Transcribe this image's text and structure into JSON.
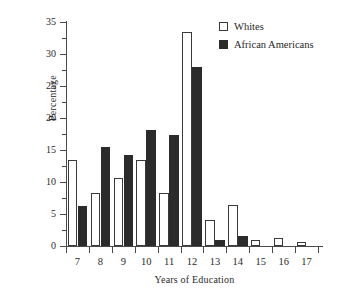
{
  "chart_data": {
    "type": "bar",
    "title": "",
    "subtitle": "",
    "xlabel": "Years of Education",
    "ylabel": "Percentage",
    "categories": [
      "7",
      "8",
      "9",
      "10",
      "11",
      "12",
      "13",
      "14",
      "15",
      "16",
      "17"
    ],
    "series": [
      {
        "name": "Whites",
        "color": "#ffffff",
        "edge_color": "#3a3a3a",
        "values": [
          13.4,
          8.3,
          10.6,
          13.4,
          8.3,
          33.4,
          4.1,
          6.4,
          1.0,
          1.3,
          0.7
        ]
      },
      {
        "name": "African Americans",
        "color": "#2b2b2b",
        "edge_color": "#2b2b2b",
        "values": [
          6.2,
          15.4,
          14.2,
          18.1,
          17.4,
          28.0,
          0.9,
          1.5,
          0.0,
          0.0,
          0.0
        ]
      }
    ],
    "ylim": [
      0,
      35
    ],
    "ytick_labels": [
      "0",
      "5",
      "10",
      "15",
      "20",
      "25",
      "30",
      "35"
    ],
    "ytick_values": [
      0,
      5,
      10,
      15,
      20,
      25,
      30,
      35
    ],
    "yminor_tick_values": [
      2.5,
      7.5,
      12.5,
      17.5,
      22.5,
      27.5,
      32.5
    ],
    "grid": false,
    "legend_position": "top-right",
    "annotations": []
  },
  "legend": {
    "entries": [
      {
        "label": "Whites",
        "swatch": "hollow-square-icon"
      },
      {
        "label": "African Americans",
        "swatch": "filled-square-icon"
      }
    ]
  },
  "axes": {
    "y_title": "Percentage",
    "x_title": "Years of Education"
  }
}
